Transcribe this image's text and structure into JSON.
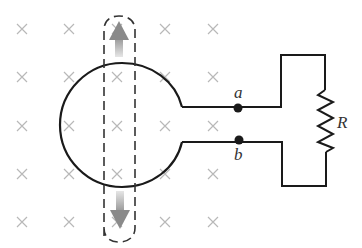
{
  "diagram": {
    "field": {
      "symbol": "×",
      "direction": "into-page",
      "color": "#b8b8b8",
      "columns_x": [
        22,
        69,
        117,
        165,
        213
      ],
      "rows_y": [
        29,
        77,
        126,
        174,
        222
      ]
    },
    "loop": {
      "shape": "circle",
      "center": [
        122,
        125
      ],
      "radius": 62,
      "stroke": "#1a1a1a"
    },
    "leads": {
      "top_y": 107,
      "bottom_y": 142
    },
    "terminals": [
      {
        "id": "a",
        "label": "a",
        "x": 238,
        "y": 108
      },
      {
        "id": "b",
        "label": "b",
        "x": 239,
        "y": 141
      }
    ],
    "resistor": {
      "label": "R",
      "x": 325,
      "y_top": 92,
      "y_bottom": 152
    },
    "sliding_rail": {
      "style": "dashed",
      "left_x": 104,
      "right_x": 135,
      "top_y": 18,
      "bottom_y": 240,
      "arrows": [
        {
          "direction": "up",
          "color": "#9a9a9a"
        },
        {
          "direction": "down",
          "color": "#9a9a9a"
        }
      ]
    },
    "labels": {
      "a": "a",
      "b": "b",
      "R": "R"
    }
  }
}
